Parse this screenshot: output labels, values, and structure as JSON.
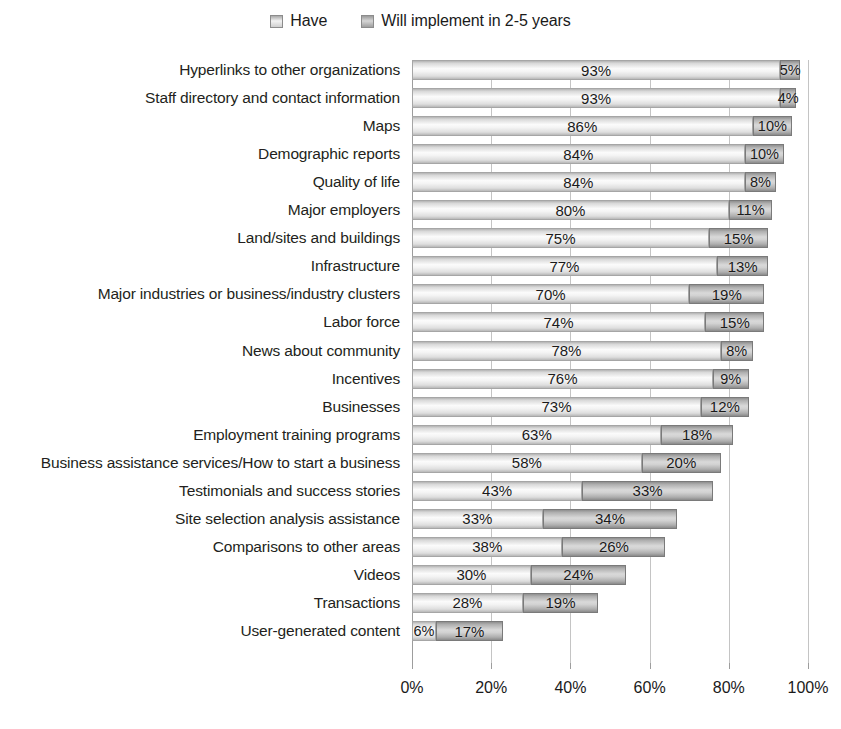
{
  "legend": {
    "entries": [
      {
        "label": "Have",
        "key": "have",
        "swatch": "legend-swatch-have"
      },
      {
        "label": "Will implement in 2-5 years",
        "key": "will",
        "swatch": "legend-swatch-will"
      }
    ]
  },
  "axis": {
    "ticks": [
      "0%",
      "20%",
      "40%",
      "60%",
      "80%",
      "100%"
    ],
    "tick_values": [
      0,
      20,
      40,
      60,
      80,
      100
    ],
    "min": 0,
    "max": 100
  },
  "chart_data": {
    "type": "bar",
    "orientation": "horizontal",
    "stacked": true,
    "title": "",
    "subtitle": "",
    "xlabel": "",
    "ylabel": "",
    "xlim": [
      0,
      100
    ],
    "grid": true,
    "legend_position": "top-center",
    "categories": [
      "Hyperlinks to other organizations",
      "Staff directory and contact information",
      "Maps",
      "Demographic reports",
      "Quality of life",
      "Major employers",
      "Land/sites and buildings",
      "Infrastructure",
      "Major industries or business/industry clusters",
      "Labor force",
      "News about community",
      "Incentives",
      "Businesses",
      "Employment training programs",
      "Business assistance services/How to start a business",
      "Testimonials and success stories",
      "Site selection analysis assistance",
      "Comparisons to other areas",
      "Videos",
      "Transactions",
      "User-generated content"
    ],
    "series": [
      {
        "name": "Have",
        "values": [
          93,
          93,
          86,
          84,
          84,
          80,
          75,
          77,
          70,
          74,
          78,
          76,
          73,
          63,
          58,
          43,
          33,
          38,
          30,
          28,
          6
        ],
        "labels": [
          "93%",
          "93%",
          "86%",
          "84%",
          "84%",
          "80%",
          "75%",
          "77%",
          "70%",
          "74%",
          "78%",
          "76%",
          "73%",
          "63%",
          "58%",
          "43%",
          "33%",
          "38%",
          "30%",
          "28%",
          "6%"
        ]
      },
      {
        "name": "Will implement in 2-5 years",
        "values": [
          5,
          4,
          10,
          10,
          8,
          11,
          15,
          13,
          19,
          15,
          8,
          9,
          12,
          18,
          20,
          33,
          34,
          26,
          24,
          19,
          17
        ],
        "labels": [
          "5%",
          "4%",
          "10%",
          "10%",
          "8%",
          "11%",
          "15%",
          "13%",
          "19%",
          "15%",
          "8%",
          "9%",
          "12%",
          "18%",
          "20%",
          "33%",
          "34%",
          "26%",
          "24%",
          "19%",
          "17%"
        ]
      }
    ]
  }
}
